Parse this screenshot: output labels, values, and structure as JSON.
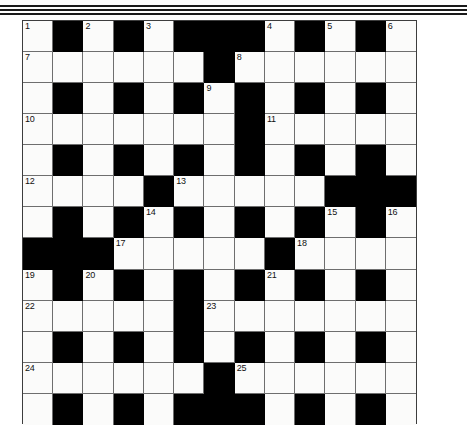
{
  "page": {
    "background_color": "#ffffff"
  },
  "decorative_rules": {
    "name": "header-rules",
    "count": 3,
    "color": "#1a1a1a"
  },
  "crossword": {
    "name": "crossword-grid",
    "columns": 13,
    "rows": 13,
    "cell_color_white": "#fbfbfa",
    "cell_color_black": "#000000",
    "border_color": "#3d3d3d",
    "grid_line_color": "#6e6e6e",
    "clue_number_color": "#111111",
    "numbers_visible": [
      1,
      2,
      3,
      4,
      5,
      6,
      7,
      8,
      9,
      10,
      11,
      12,
      13,
      14,
      15,
      16,
      17,
      18,
      19,
      20,
      21,
      22,
      23,
      24,
      25
    ],
    "layout": [
      [
        "W1",
        "B",
        "W2",
        "B",
        "W3",
        "B",
        "B",
        "B",
        "W4",
        "B",
        "W5",
        "B",
        "W6"
      ],
      [
        "W7",
        "W",
        "W",
        "W",
        "W",
        "W",
        "B",
        "W8",
        "W",
        "W",
        "W",
        "W",
        "W"
      ],
      [
        "W",
        "B",
        "W",
        "B",
        "W",
        "B",
        "W9",
        "B",
        "W",
        "B",
        "W",
        "B",
        "W"
      ],
      [
        "W10",
        "W",
        "W",
        "W",
        "W",
        "W",
        "W",
        "B",
        "W11",
        "W",
        "W",
        "W",
        "W"
      ],
      [
        "W",
        "B",
        "W",
        "B",
        "W",
        "B",
        "W",
        "B",
        "W",
        "B",
        "W",
        "B",
        "W"
      ],
      [
        "W12",
        "W",
        "W",
        "W",
        "B",
        "W13",
        "W",
        "W",
        "W",
        "W",
        "B",
        "B",
        "B"
      ],
      [
        "W",
        "B",
        "W",
        "B",
        "W14",
        "B",
        "W",
        "B",
        "W",
        "B",
        "W15",
        "B",
        "W16"
      ],
      [
        "B",
        "B",
        "B",
        "W17",
        "W",
        "W",
        "W",
        "W",
        "B",
        "W18",
        "W",
        "W",
        "W"
      ],
      [
        "W19",
        "B",
        "W20",
        "B",
        "W",
        "B",
        "W",
        "B",
        "W21",
        "B",
        "W",
        "B",
        "W"
      ],
      [
        "W22",
        "W",
        "W",
        "W",
        "W",
        "B",
        "W23",
        "W",
        "W",
        "W",
        "W",
        "W",
        "W"
      ],
      [
        "W",
        "B",
        "W",
        "B",
        "W",
        "B",
        "W",
        "B",
        "W",
        "B",
        "W",
        "B",
        "W"
      ],
      [
        "W24",
        "W",
        "W",
        "W",
        "W",
        "W",
        "B",
        "W25",
        "W",
        "W",
        "W",
        "W",
        "W"
      ],
      [
        "W",
        "B",
        "W",
        "B",
        "W",
        "B",
        "B",
        "B",
        "W",
        "B",
        "W",
        "B",
        "W"
      ]
    ]
  }
}
